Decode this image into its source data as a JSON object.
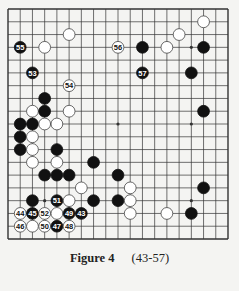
{
  "diagram": {
    "type": "go-board",
    "size": 19,
    "colors": {
      "background": "#f4f4f2",
      "line": "#333333",
      "black": "#111111",
      "white": "#ffffff"
    },
    "star_points": [
      [
        3,
        3
      ],
      [
        9,
        3
      ],
      [
        15,
        3
      ],
      [
        3,
        9
      ],
      [
        9,
        9
      ],
      [
        15,
        9
      ],
      [
        3,
        15
      ],
      [
        9,
        15
      ],
      [
        15,
        15
      ]
    ],
    "stones": [
      {
        "c": 5,
        "r": 2,
        "color": "white"
      },
      {
        "c": 1,
        "r": 3,
        "color": "black",
        "label": "55"
      },
      {
        "c": 3,
        "r": 3,
        "color": "white"
      },
      {
        "c": 9,
        "r": 3,
        "color": "white",
        "label": "56"
      },
      {
        "c": 11,
        "r": 3,
        "color": "black"
      },
      {
        "c": 13,
        "r": 3,
        "color": "white"
      },
      {
        "c": 14,
        "r": 2,
        "color": "white"
      },
      {
        "c": 16,
        "r": 1,
        "color": "white"
      },
      {
        "c": 16,
        "r": 3,
        "color": "black"
      },
      {
        "c": 2,
        "r": 5,
        "color": "black",
        "label": "53"
      },
      {
        "c": 11,
        "r": 5,
        "color": "black",
        "label": "57"
      },
      {
        "c": 15,
        "r": 5,
        "color": "black"
      },
      {
        "c": 5,
        "r": 6,
        "color": "white",
        "label": "54"
      },
      {
        "c": 3,
        "r": 7,
        "color": "black"
      },
      {
        "c": 2,
        "r": 8,
        "color": "white"
      },
      {
        "c": 3,
        "r": 8,
        "color": "black"
      },
      {
        "c": 5,
        "r": 8,
        "color": "white"
      },
      {
        "c": 16,
        "r": 8,
        "color": "black"
      },
      {
        "c": 1,
        "r": 9,
        "color": "black"
      },
      {
        "c": 2,
        "r": 9,
        "color": "black"
      },
      {
        "c": 3,
        "r": 9,
        "color": "white"
      },
      {
        "c": 4,
        "r": 9,
        "color": "white"
      },
      {
        "c": 1,
        "r": 10,
        "color": "black"
      },
      {
        "c": 2,
        "r": 10,
        "color": "white"
      },
      {
        "c": 1,
        "r": 11,
        "color": "black"
      },
      {
        "c": 2,
        "r": 11,
        "color": "white"
      },
      {
        "c": 4,
        "r": 11,
        "color": "black"
      },
      {
        "c": 2,
        "r": 12,
        "color": "white"
      },
      {
        "c": 4,
        "r": 12,
        "color": "white"
      },
      {
        "c": 7,
        "r": 12,
        "color": "black"
      },
      {
        "c": 3,
        "r": 13,
        "color": "black"
      },
      {
        "c": 4,
        "r": 13,
        "color": "black"
      },
      {
        "c": 5,
        "r": 13,
        "color": "black"
      },
      {
        "c": 9,
        "r": 13,
        "color": "black"
      },
      {
        "c": 6,
        "r": 14,
        "color": "white"
      },
      {
        "c": 10,
        "r": 14,
        "color": "white"
      },
      {
        "c": 16,
        "r": 14,
        "color": "black"
      },
      {
        "c": 2,
        "r": 15,
        "color": "black"
      },
      {
        "c": 4,
        "r": 15,
        "color": "black",
        "label": "51"
      },
      {
        "c": 5,
        "r": 15,
        "color": "white"
      },
      {
        "c": 7,
        "r": 15,
        "color": "black"
      },
      {
        "c": 9,
        "r": 15,
        "color": "black"
      },
      {
        "c": 10,
        "r": 15,
        "color": "white"
      },
      {
        "c": 1,
        "r": 16,
        "color": "white",
        "label": "44"
      },
      {
        "c": 2,
        "r": 16,
        "color": "black",
        "label": "45"
      },
      {
        "c": 3,
        "r": 16,
        "color": "white",
        "label": "52"
      },
      {
        "c": 4,
        "r": 16,
        "color": "white"
      },
      {
        "c": 5,
        "r": 16,
        "color": "black",
        "label": "49"
      },
      {
        "c": 6,
        "r": 16,
        "color": "black",
        "label": "43"
      },
      {
        "c": 10,
        "r": 16,
        "color": "white"
      },
      {
        "c": 13,
        "r": 16,
        "color": "white"
      },
      {
        "c": 15,
        "r": 16,
        "color": "black"
      },
      {
        "c": 1,
        "r": 17,
        "color": "white",
        "label": "46"
      },
      {
        "c": 2,
        "r": 17,
        "color": "white"
      },
      {
        "c": 3,
        "r": 17,
        "color": "white",
        "label": "50"
      },
      {
        "c": 4,
        "r": 17,
        "color": "black",
        "label": "47"
      },
      {
        "c": 5,
        "r": 17,
        "color": "white",
        "label": "48"
      }
    ]
  },
  "caption": {
    "figure": "Figure 4",
    "moves": "(43-57)"
  }
}
